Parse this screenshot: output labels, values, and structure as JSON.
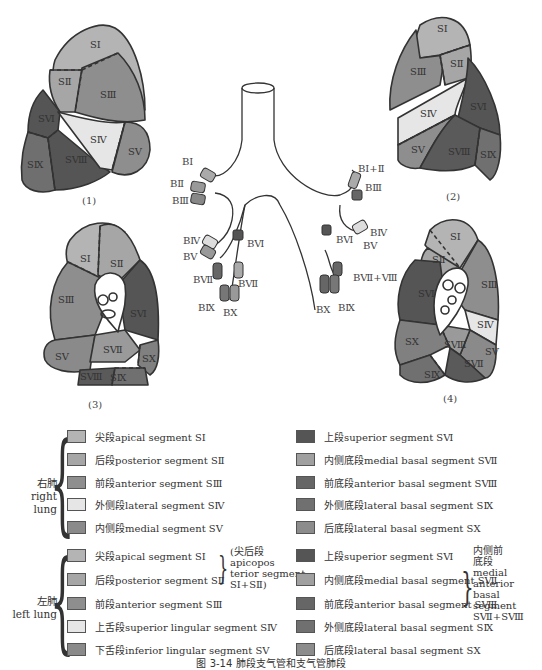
{
  "figures": [
    {
      "id": "fig1",
      "caption": "(1)",
      "segments": [
        "SⅠ",
        "SⅡ",
        "SⅢ",
        "SⅣ",
        "SⅤ",
        "SⅥ",
        "SⅧ",
        "SⅨ"
      ]
    },
    {
      "id": "fig2",
      "caption": "(2)",
      "segments": [
        "SⅠ",
        "SⅡ",
        "SⅢ",
        "SⅣ",
        "SⅤ",
        "SⅥ",
        "SⅧ",
        "SⅨ"
      ]
    },
    {
      "id": "fig3",
      "caption": "(3)",
      "segments": [
        "SⅠ",
        "SⅡ",
        "SⅢ",
        "SⅤ",
        "SⅥ",
        "SⅦ",
        "SⅧ",
        "SⅨ",
        "SⅩ"
      ]
    },
    {
      "id": "fig4",
      "caption": "(4)",
      "segments": [
        "SⅠ",
        "SⅡ",
        "SⅢ",
        "SⅣ",
        "SⅤ",
        "SⅥ",
        "SⅧ",
        "SⅦ",
        "SⅨ",
        "SⅩ"
      ]
    }
  ],
  "bronchi": {
    "right": [
      "BⅠ",
      "BⅡ",
      "BⅢ",
      "BⅣ",
      "BⅤ",
      "BⅥ",
      "BⅦ",
      "BⅦ",
      "BⅨ",
      "BⅩ"
    ],
    "left": [
      "BⅠ+Ⅱ",
      "BⅢ",
      "BⅣ",
      "BⅤ",
      "BⅥ",
      "BⅦ+Ⅷ",
      "BⅩ",
      "BⅨ"
    ]
  },
  "colors": {
    "s1": "#b4b4b4",
    "s2": "#a6a6a6",
    "s3": "#8e8e8e",
    "s4": "#e6e6e6",
    "s5": "#8a8a8a",
    "s6": "#555555",
    "s7": "#9a9a9a",
    "s8": "#6a6a6a",
    "s9": "#707070",
    "s10": "#808080",
    "outline": "#333333"
  },
  "legend": {
    "right_lung": {
      "label_cn": "右肺",
      "label_en": "right lung",
      "col1": [
        {
          "text": "尖段apical segment SⅠ",
          "color": "#b4b4b4"
        },
        {
          "text": "后段posterior segment SⅡ",
          "color": "#a6a6a6"
        },
        {
          "text": "前段anterior segment SⅢ",
          "color": "#8e8e8e"
        },
        {
          "text": "外侧段lateral segment SⅣ",
          "color": "#e6e6e6"
        },
        {
          "text": "内侧段medial segment SⅤ",
          "color": "#8a8a8a"
        }
      ],
      "col2": [
        {
          "text": "上段superior segment SⅥ",
          "color": "#555555"
        },
        {
          "text": "内侧底段medial basal segment SⅦ",
          "color": "#a0a0a0"
        },
        {
          "text": "前底段anterior basal segment SⅧ",
          "color": "#666666"
        },
        {
          "text": "外侧底段lateral basal segment SⅨ",
          "color": "#707070"
        },
        {
          "text": "后底段lateral basal segment SⅩ",
          "color": "#8c8c8c"
        }
      ]
    },
    "left_lung": {
      "label_cn": "左肺",
      "label_en": "left lung",
      "col1": [
        {
          "text": "尖段apical segment SⅠ",
          "color": "#b4b4b4"
        },
        {
          "text": "后段posterior segment SⅡ",
          "color": "#a6a6a6"
        },
        {
          "text": "前段anterior segment SⅢ",
          "color": "#8e8e8e"
        },
        {
          "text": "上舌段superior lingular segment SⅣ",
          "color": "#e6e6e6"
        },
        {
          "text": "下舌段inferior lingular segment SⅤ",
          "color": "#8a8a8a"
        }
      ],
      "col1_note": [
        "(尖后段",
        "apicopos",
        "terior segment",
        "SⅠ+SⅡ)"
      ],
      "col2": [
        {
          "text": "上段superior segment SⅥ",
          "color": "#555555"
        },
        {
          "text": "内侧底段medial basal segment SⅦ",
          "color": "#a0a0a0"
        },
        {
          "text": "前底段anterior basal segment SⅧ",
          "color": "#666666"
        },
        {
          "text": "外侧底段lateral basal segment SⅨ",
          "color": "#707070"
        },
        {
          "text": "后底段lateral basal segment SⅩ",
          "color": "#8c8c8c"
        }
      ],
      "col2_note": [
        "内侧前",
        "底段",
        "medial",
        "anterior",
        "basal",
        "segment",
        "SⅦ+SⅧ"
      ]
    }
  },
  "caption": "图 3-14    肺段支气管和支气管肺段"
}
